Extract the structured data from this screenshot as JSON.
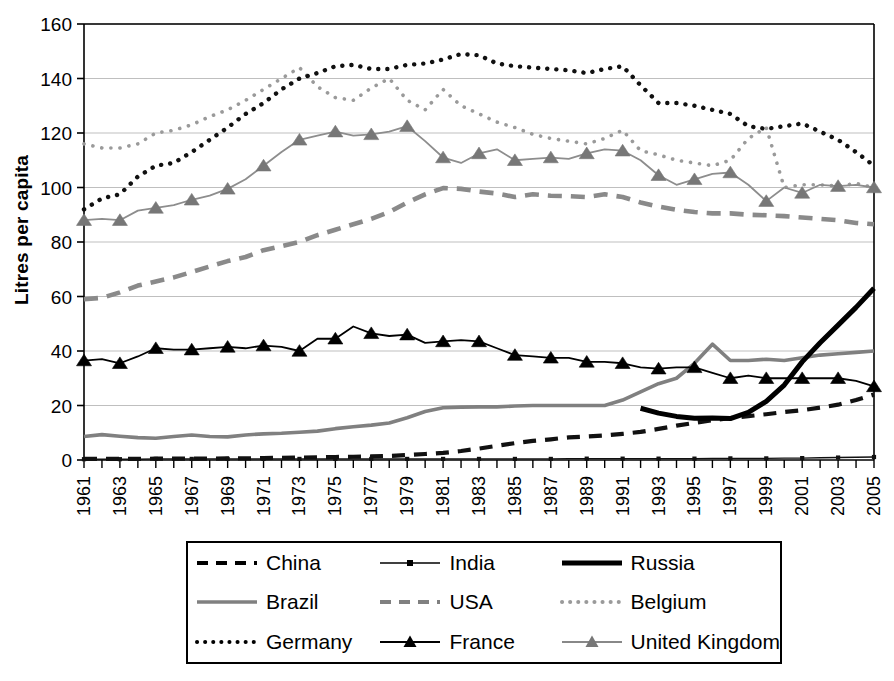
{
  "axes": {
    "ylabel": "Litres per capita",
    "yticks": [
      0,
      20,
      40,
      60,
      80,
      100,
      120,
      140,
      160
    ],
    "ylim": [
      0,
      160
    ],
    "xlim": [
      1961,
      2005
    ],
    "xticklabels": [
      "1961",
      "1963",
      "1965",
      "1967",
      "1969",
      "1971",
      "1973",
      "1975",
      "1977",
      "1979",
      "1981",
      "1983",
      "1985",
      "1987",
      "1989",
      "1991",
      "1993",
      "1995",
      "1997",
      "1999",
      "2001",
      "2003",
      "2005"
    ]
  },
  "legend": {
    "entries": [
      {
        "label": "China",
        "style": "dashed",
        "color": "#000000"
      },
      {
        "label": "India",
        "style": "thin-square",
        "color": "#000000"
      },
      {
        "label": "Russia",
        "style": "thick-solid",
        "color": "#000000"
      },
      {
        "label": "Brazil",
        "style": "solid",
        "color": "#808080"
      },
      {
        "label": "USA",
        "style": "dashed",
        "color": "#808080"
      },
      {
        "label": "Belgium",
        "style": "dotted",
        "color": "#9a9a9a"
      },
      {
        "label": "Germany",
        "style": "dotted",
        "color": "#000000"
      },
      {
        "label": "France",
        "style": "triangle",
        "color": "#000000"
      },
      {
        "label": "United Kingdom",
        "style": "triangle",
        "color": "#888888"
      }
    ]
  },
  "chart_data": {
    "type": "line",
    "title": "",
    "xlabel": "",
    "ylabel": "Litres per capita",
    "xlim": [
      1961,
      2005
    ],
    "ylim": [
      0,
      160
    ],
    "grid": true,
    "legend_position": "bottom",
    "x": [
      1961,
      1962,
      1963,
      1964,
      1965,
      1966,
      1967,
      1968,
      1969,
      1970,
      1971,
      1972,
      1973,
      1974,
      1975,
      1976,
      1977,
      1978,
      1979,
      1980,
      1981,
      1982,
      1983,
      1984,
      1985,
      1986,
      1987,
      1988,
      1989,
      1990,
      1991,
      1992,
      1993,
      1994,
      1995,
      1996,
      1997,
      1998,
      1999,
      2000,
      2001,
      2002,
      2003,
      2004,
      2005
    ],
    "series": [
      {
        "name": "China",
        "values": [
          0.4,
          0.4,
          0.4,
          0.4,
          0.5,
          0.5,
          0.5,
          0.5,
          0.6,
          0.6,
          0.7,
          0.8,
          0.9,
          1.0,
          1.1,
          1.2,
          1.3,
          1.5,
          1.8,
          2.2,
          2.6,
          3.3,
          4.2,
          5.2,
          6.2,
          7.0,
          7.6,
          8.3,
          8.6,
          9.0,
          9.6,
          10.3,
          11.4,
          12.6,
          13.6,
          14.6,
          15.4,
          16.1,
          16.8,
          17.6,
          18.3,
          19.2,
          20.3,
          22.0,
          24.0
        ]
      },
      {
        "name": "India",
        "values": [
          0.3,
          0.3,
          0.3,
          0.3,
          0.4,
          0.4,
          0.4,
          0.4,
          0.4,
          0.4,
          0.4,
          0.4,
          0.4,
          0.4,
          0.4,
          0.4,
          0.4,
          0.4,
          0.4,
          0.4,
          0.4,
          0.4,
          0.4,
          0.4,
          0.4,
          0.4,
          0.4,
          0.5,
          0.5,
          0.5,
          0.5,
          0.5,
          0.5,
          0.5,
          0.5,
          0.6,
          0.6,
          0.6,
          0.6,
          0.7,
          0.7,
          0.8,
          0.9,
          1.0,
          1.1
        ]
      },
      {
        "name": "Russia",
        "values": [
          null,
          null,
          null,
          null,
          null,
          null,
          null,
          null,
          null,
          null,
          null,
          null,
          null,
          null,
          null,
          null,
          null,
          null,
          null,
          null,
          null,
          null,
          null,
          null,
          null,
          null,
          null,
          null,
          null,
          null,
          null,
          19.0,
          17.2,
          16.0,
          15.3,
          15.4,
          15.2,
          17.5,
          21.5,
          27.5,
          36.0,
          43.0,
          49.5,
          56.0,
          63.0
        ]
      },
      {
        "name": "Brazil",
        "values": [
          8.6,
          9.3,
          8.7,
          8.2,
          8.0,
          8.6,
          9.2,
          8.6,
          8.5,
          9.2,
          9.6,
          9.8,
          10.2,
          10.6,
          11.5,
          12.2,
          12.8,
          13.6,
          15.5,
          17.8,
          19.2,
          19.4,
          19.5,
          19.5,
          19.8,
          20.0,
          20.0,
          20.0,
          20.0,
          20.0,
          22.0,
          25.0,
          28.0,
          30.0,
          35.5,
          42.5,
          36.5,
          36.5,
          37.0,
          36.5,
          37.5,
          38.5,
          39.0,
          39.5,
          40.0
        ]
      },
      {
        "name": "USA",
        "values": [
          59.0,
          59.5,
          61.5,
          64.0,
          65.5,
          67.0,
          69.0,
          71.0,
          73.0,
          74.5,
          77.0,
          78.5,
          80.0,
          82.5,
          84.5,
          86.5,
          88.5,
          91.0,
          94.5,
          97.5,
          99.8,
          99.5,
          98.5,
          97.8,
          96.5,
          97.5,
          97.0,
          96.8,
          96.5,
          97.5,
          96.5,
          94.5,
          93.0,
          91.8,
          91.0,
          90.5,
          90.5,
          90.0,
          89.8,
          89.5,
          89.0,
          88.5,
          88.0,
          87.0,
          86.5
        ]
      },
      {
        "name": "Belgium",
        "values": [
          116.0,
          114.5,
          114.5,
          116.0,
          120.0,
          121.0,
          123.0,
          126.0,
          128.5,
          132.0,
          136.0,
          140.0,
          144.0,
          137.0,
          133.0,
          132.0,
          136.5,
          140.0,
          132.0,
          128.5,
          136.0,
          130.0,
          127.0,
          124.0,
          122.0,
          119.5,
          118.0,
          117.0,
          116.0,
          118.0,
          121.0,
          113.5,
          112.0,
          110.0,
          109.0,
          108.0,
          110.0,
          118.0,
          122.0,
          100.0,
          101.0,
          101.0,
          100.5,
          101.5,
          100.0
        ]
      },
      {
        "name": "Germany",
        "values": [
          92.0,
          96.0,
          97.5,
          104.0,
          108.0,
          109.0,
          113.0,
          117.5,
          122.0,
          127.0,
          131.0,
          136.0,
          140.0,
          142.0,
          144.5,
          145.0,
          143.5,
          143.5,
          145.0,
          145.5,
          147.0,
          149.0,
          148.5,
          145.5,
          144.5,
          144.0,
          143.5,
          143.0,
          142.0,
          143.5,
          144.5,
          137.5,
          131.0,
          131.0,
          130.0,
          128.5,
          127.0,
          122.5,
          121.5,
          122.5,
          123.5,
          120.5,
          117.5,
          113.0,
          108.0
        ]
      },
      {
        "name": "France",
        "values": [
          36.5,
          37.0,
          35.5,
          38.0,
          41.0,
          40.5,
          40.5,
          41.0,
          41.5,
          41.0,
          42.0,
          41.5,
          40.0,
          44.5,
          44.5,
          49.0,
          46.5,
          45.5,
          46.0,
          43.0,
          43.5,
          44.0,
          43.5,
          41.0,
          38.5,
          38.0,
          37.5,
          37.5,
          36.0,
          36.0,
          35.5,
          34.0,
          33.5,
          34.0,
          34.0,
          32.0,
          30.0,
          31.0,
          30.0,
          30.0,
          30.0,
          30.0,
          30.0,
          29.0,
          27.0
        ]
      },
      {
        "name": "United Kingdom",
        "values": [
          88.0,
          88.5,
          88.0,
          91.5,
          92.5,
          93.5,
          95.5,
          97.0,
          99.5,
          103.0,
          108.0,
          113.0,
          117.5,
          119.0,
          120.5,
          119.0,
          119.5,
          120.5,
          122.5,
          117.0,
          111.0,
          109.0,
          112.5,
          114.0,
          110.0,
          110.5,
          111.0,
          110.5,
          112.5,
          114.0,
          113.5,
          110.0,
          104.5,
          101.0,
          103.0,
          105.0,
          105.5,
          101.0,
          95.0,
          100.0,
          98.0,
          101.0,
          100.5,
          101.0,
          100.0
        ]
      }
    ]
  }
}
